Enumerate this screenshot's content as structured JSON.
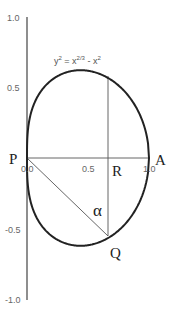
{
  "diagram": {
    "equation": {
      "lhs": "y",
      "lhs_exp": "2",
      "eq": " = x",
      "mid_exp": "2/3",
      "minus": " - x",
      "rhs_exp": "2"
    },
    "y_ticks": [
      {
        "label": "1.0",
        "value": 1.0
      },
      {
        "label": "0.5",
        "value": 0.5
      },
      {
        "label": "-0.5",
        "value": -0.5
      },
      {
        "label": "-1.0",
        "value": -1.0
      }
    ],
    "x_ticks": [
      {
        "label": "0.0",
        "value": 0.0
      },
      {
        "label": "0.5",
        "value": 0.5
      },
      {
        "label": "1.0",
        "value": 1.0
      }
    ],
    "points": {
      "P": "P",
      "A": "A",
      "R": "R",
      "Q": "Q"
    },
    "angle_label": "α",
    "colors": {
      "curve": "#222222",
      "axis": "#444444",
      "lines": "#555555",
      "tick_text": "#666666"
    }
  }
}
